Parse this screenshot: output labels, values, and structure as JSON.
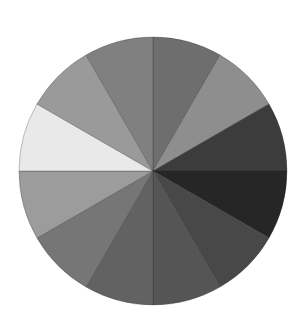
{
  "chart_data": {
    "type": "pie",
    "title": "",
    "legend": [],
    "center": [
      153,
      171
    ],
    "radius": 134,
    "start_angle_deg": 0,
    "direction": "clockwise",
    "categories": [
      "S1",
      "S2",
      "S3",
      "S4",
      "S5",
      "S6",
      "S7",
      "S8",
      "S9",
      "S10",
      "S11",
      "S12"
    ],
    "values": [
      1,
      1,
      1,
      1,
      1,
      1,
      1,
      1,
      1,
      1,
      1,
      1
    ],
    "colors": [
      "#6e6e6e",
      "#8e8e8e",
      "#3c3c3c",
      "#262626",
      "#484848",
      "#555555",
      "#626262",
      "#767676",
      "#9c9c9c",
      "#e9e9e9",
      "#9a9a9a",
      "#808080"
    ]
  }
}
